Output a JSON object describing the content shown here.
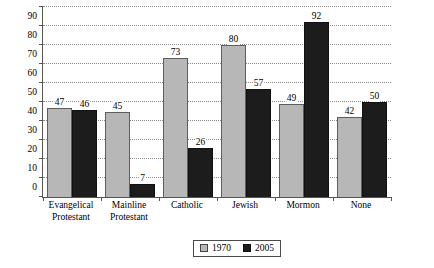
{
  "chart_data": {
    "type": "bar",
    "title": "",
    "xlabel": "",
    "ylabel": "Percent",
    "ylim": [
      0,
      100
    ],
    "ytick_step": 10,
    "yticks": [
      0,
      10,
      20,
      30,
      40,
      50,
      60,
      70,
      80,
      90,
      100
    ],
    "grid": true,
    "grid_style": "dotted-horizontal",
    "legend_position": "bottom-center",
    "categories": [
      "Evangelical Protestant",
      "Mainline Protestant",
      "Catholic",
      "Jewish",
      "Mormon",
      "None"
    ],
    "category_lines": [
      [
        "Evangelical",
        "Protestant"
      ],
      [
        "Mainline",
        "Protestant"
      ],
      [
        "Catholic",
        ""
      ],
      [
        "Jewish",
        ""
      ],
      [
        "Mormon",
        ""
      ],
      [
        "None",
        ""
      ]
    ],
    "series": [
      {
        "name": "1970",
        "color": "#b7b7b7",
        "values": [
          47,
          45,
          73,
          80,
          49,
          42
        ]
      },
      {
        "name": "2005",
        "color": "#1c1c1c",
        "values": [
          46,
          7,
          26,
          57,
          92,
          50
        ]
      }
    ]
  },
  "legend": {
    "items": [
      {
        "label": "1970",
        "swatch": "light-gray"
      },
      {
        "label": "2005",
        "swatch": "black"
      }
    ]
  }
}
